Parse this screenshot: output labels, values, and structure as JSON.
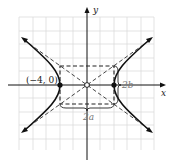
{
  "figure": {
    "type": "hyperbola",
    "orientation": "horizontal transverse axis",
    "axis_labels": {
      "x": "x",
      "y": "y"
    },
    "vertex_label": "(−4, 0)",
    "dimension_labels": {
      "width": "2a",
      "height": "2b"
    },
    "vertices": [
      [
        -4,
        0
      ],
      [
        4,
        0
      ]
    ],
    "center": [
      0,
      0
    ],
    "a": 4,
    "b": 3,
    "colors": {
      "curve": "#111111",
      "grid": "#dddddd",
      "asymptote": "#333333",
      "label_gray": "#777777"
    }
  }
}
